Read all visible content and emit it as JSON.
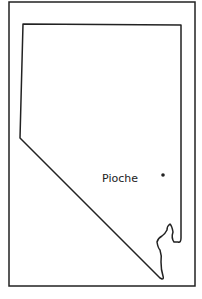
{
  "map": {
    "region": "Nevada",
    "places": [
      {
        "name": "Pioche",
        "marker": "dot"
      }
    ],
    "colors": {
      "line": "#222222",
      "background": "#ffffff"
    }
  }
}
